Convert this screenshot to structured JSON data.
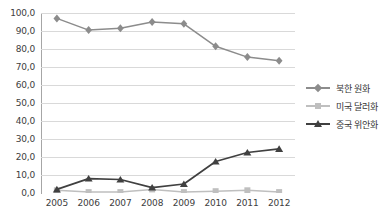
{
  "top_artifact": " ",
  "chart_data": {
    "type": "line",
    "title": "",
    "subtitle": "",
    "xlabel": "",
    "ylabel": "",
    "categories": [
      "2005",
      "2006",
      "2007",
      "2008",
      "2009",
      "2010",
      "2011",
      "2012"
    ],
    "ylim": [
      0.0,
      100.0
    ],
    "ytick_step": 10.0,
    "yticks": [
      "0,0",
      "10,0",
      "20,0",
      "30,0",
      "40,0",
      "50,0",
      "60,0",
      "70,0",
      "80,0",
      "90,0",
      "100,0"
    ],
    "ytick_values": [
      0,
      10,
      20,
      30,
      40,
      50,
      60,
      70,
      80,
      90,
      100
    ],
    "grid": true,
    "grid_axis": "y",
    "legend_position": "right",
    "series": [
      {
        "name": "북한 원화",
        "marker": "diamond",
        "color": "#8c8c8c",
        "values": [
          97.0,
          90.5,
          91.5,
          95.0,
          94.0,
          81.5,
          75.5,
          73.5
        ]
      },
      {
        "name": "미국 달러화",
        "marker": "square",
        "color": "#bfbfbf",
        "values": [
          1.5,
          0.5,
          0.5,
          2.0,
          0.5,
          1.0,
          1.5,
          0.5
        ]
      },
      {
        "name": "중국 위안화",
        "marker": "triangle",
        "color": "#404040",
        "values": [
          2.0,
          8.0,
          7.5,
          3.0,
          5.0,
          17.5,
          22.5,
          24.5
        ]
      }
    ]
  },
  "colors": {
    "background": "#ffffff",
    "gridline": "#d9d9d9",
    "axis": "#a6a6a6",
    "tick_text": "#404040",
    "legend_text": "#333333"
  }
}
